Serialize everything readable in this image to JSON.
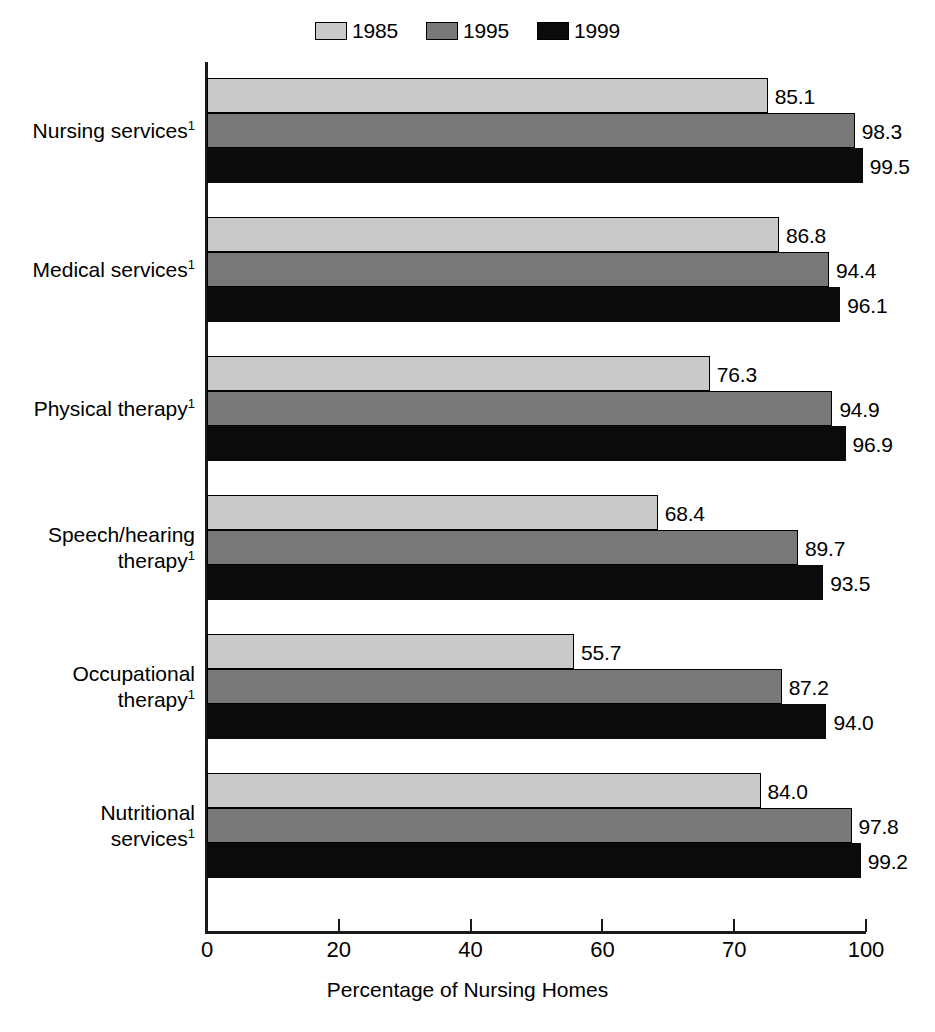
{
  "chart_data": {
    "type": "bar",
    "orientation": "horizontal",
    "title": "",
    "xlabel": "Percentage of Nursing Homes",
    "ylabel": "",
    "xlim": [
      0,
      100
    ],
    "xticks": [
      "0",
      "20",
      "40",
      "60",
      "70",
      "100"
    ],
    "xtick_values": [
      0,
      20,
      40,
      60,
      80,
      100
    ],
    "grid": false,
    "legend_position": "top-center",
    "categories": [
      "Nursing services",
      "Medical services",
      "Physical therapy",
      "Speech/hearing\ntherapy",
      "Occupational\ntherapy",
      "Nutritional\nservices"
    ],
    "category_footnote": "1",
    "series": [
      {
        "name": "1985",
        "color": "#c9c9c9",
        "values": [
          85.1,
          86.8,
          76.3,
          68.4,
          55.7,
          84.0
        ]
      },
      {
        "name": "1995",
        "color": "#787878",
        "values": [
          98.3,
          94.4,
          94.9,
          89.7,
          87.2,
          97.8
        ]
      },
      {
        "name": "1999",
        "color": "#0b0b0b",
        "values": [
          99.5,
          96.1,
          96.9,
          93.5,
          94.0,
          99.2
        ]
      }
    ],
    "value_labels": [
      [
        "85.1",
        "98.3",
        "99.5"
      ],
      [
        "86.8",
        "94.4",
        "96.1"
      ],
      [
        "76.3",
        "94.9",
        "96.9"
      ],
      [
        "68.4",
        "89.7",
        "93.5"
      ],
      [
        "55.7",
        "87.2",
        "94.0"
      ],
      [
        "84.0",
        "97.8",
        "99.2"
      ]
    ]
  },
  "legend": {
    "items": [
      {
        "label": "1985",
        "color": "#c9c9c9"
      },
      {
        "label": "1995",
        "color": "#787878"
      },
      {
        "label": "1999",
        "color": "#0b0b0b"
      }
    ]
  },
  "axis": {
    "x_title": "Percentage of Nursing Homes",
    "ticks": [
      "0",
      "20",
      "40",
      "60",
      "70",
      "100"
    ]
  }
}
